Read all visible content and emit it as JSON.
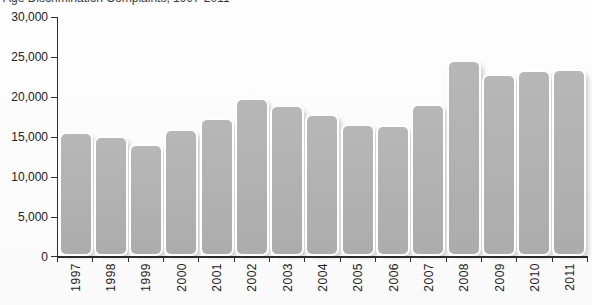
{
  "page": {
    "background": "#fcfcfc"
  },
  "chart_data": {
    "type": "bar",
    "title": "Age Discrimination Complaints, 1997-2011",
    "categories": [
      "1997",
      "1998",
      "1999",
      "2000",
      "2001",
      "2002",
      "2003",
      "2004",
      "2005",
      "2006",
      "2007",
      "2008",
      "2009",
      "2010",
      "2011"
    ],
    "values": [
      15500,
      15000,
      14000,
      15900,
      17200,
      19800,
      18900,
      17700,
      16500,
      16400,
      19000,
      24500,
      22700,
      23200,
      23400
    ],
    "xlabel": "",
    "ylabel": "",
    "ylim": [
      0,
      30000
    ],
    "ytick_step": 5000,
    "ytick_labels": [
      "0",
      "5,000",
      "10,000",
      "15,000",
      "20,000",
      "25,000",
      "30,000"
    ],
    "grid": false,
    "legend": null,
    "bar_color": "#b0b0b0",
    "axis_color": "#2e2e2e",
    "label_color": "#222222"
  }
}
